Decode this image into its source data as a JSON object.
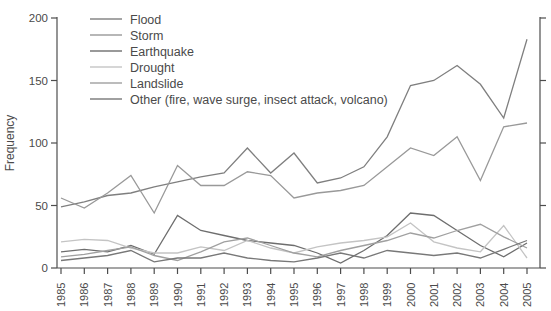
{
  "chart_data": {
    "type": "line",
    "title": "",
    "xlabel": "",
    "ylabel": "Frequency",
    "ylim": [
      0,
      200
    ],
    "yticks": [
      0,
      50,
      100,
      150,
      200
    ],
    "grid": false,
    "legend_position": "top-left",
    "x": [
      1985,
      1986,
      1987,
      1988,
      1989,
      1990,
      1991,
      1992,
      1993,
      1994,
      1995,
      1996,
      1997,
      1998,
      1999,
      2000,
      2001,
      2002,
      2003,
      2004,
      2005
    ],
    "series": [
      {
        "name": "Flood",
        "color": "#7f7f7f",
        "values": [
          49,
          53,
          58,
          60,
          65,
          69,
          73,
          76,
          96,
          76,
          92,
          68,
          72,
          81,
          105,
          146,
          150,
          162,
          147,
          120,
          183
        ]
      },
      {
        "name": "Storm",
        "color": "#999999",
        "values": [
          56,
          48,
          60,
          74,
          44,
          82,
          66,
          66,
          77,
          74,
          56,
          60,
          62,
          66,
          81,
          96,
          90,
          105,
          70,
          113,
          116
        ]
      },
      {
        "name": "Earthquake",
        "color": "#6e6e6e",
        "values": [
          13,
          15,
          13,
          18,
          11,
          42,
          30,
          26,
          22,
          20,
          18,
          12,
          4,
          14,
          26,
          44,
          42,
          30,
          18,
          9,
          20
        ]
      },
      {
        "name": "Drought",
        "color": "#c4c4c4",
        "values": [
          21,
          23,
          22,
          16,
          12,
          12,
          17,
          14,
          22,
          16,
          12,
          17,
          20,
          22,
          25,
          36,
          21,
          16,
          13,
          34,
          8
        ]
      },
      {
        "name": "Landslide",
        "color": "#a0a0a0",
        "values": [
          9,
          11,
          14,
          17,
          10,
          6,
          13,
          21,
          24,
          18,
          12,
          9,
          14,
          18,
          22,
          28,
          24,
          30,
          35,
          25,
          16
        ]
      },
      {
        "name": "Other (fire, wave surge, insect attack, volcano)",
        "color": "#787878",
        "values": [
          6,
          8,
          10,
          14,
          5,
          8,
          8,
          12,
          8,
          6,
          5,
          8,
          12,
          8,
          14,
          12,
          10,
          12,
          8,
          15,
          22
        ]
      }
    ]
  },
  "layout_colors": {
    "axis": "#4d4d4d",
    "tick_label": "#4a4a4a",
    "background": "#ffffff"
  }
}
